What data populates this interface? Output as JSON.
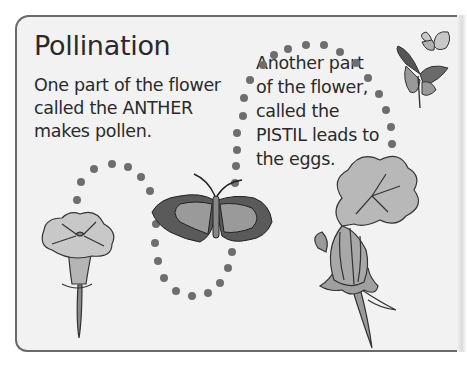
{
  "page": {
    "title": "Pollination",
    "paragraph_anther": [
      "One part of the flower",
      "called the ANTHER",
      "makes pollen."
    ],
    "paragraph_pistil": [
      "Another part",
      "of the flower,",
      "called the",
      "PISTIL leads to",
      "the eggs."
    ]
  },
  "illustrations": {
    "left_flower": "trumpet-flower-anther",
    "center_butterfly": "moth-butterfly",
    "right_flower": "squash-flower-pistil",
    "top_right_butterflies": "two-butterflies",
    "path": "dotted-flight-path"
  },
  "colors": {
    "panel_bg": "#f2f2f2",
    "border": "#6a6a6a",
    "text": "#2a2a2a",
    "dots": "#6e6e6e"
  }
}
